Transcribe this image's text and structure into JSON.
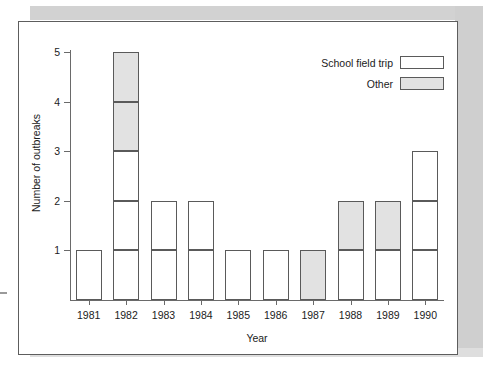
{
  "chart_data": {
    "type": "bar",
    "subtype": "stacked-bar",
    "title": "",
    "xlabel": "Year",
    "ylabel": "Number of outbreaks",
    "categories": [
      "1981",
      "1982",
      "1983",
      "1984",
      "1985",
      "1986",
      "1987",
      "1988",
      "1989",
      "1990"
    ],
    "series": [
      {
        "name": "School field trip",
        "fill": "#ffffff",
        "values": [
          1,
          3,
          2,
          2,
          1,
          1,
          0,
          1,
          1,
          3
        ]
      },
      {
        "name": "Other",
        "fill": "#e2e2e2",
        "values": [
          0,
          2,
          0,
          0,
          0,
          0,
          1,
          1,
          1,
          0
        ]
      }
    ],
    "totals": [
      1,
      5,
      2,
      2,
      1,
      1,
      1,
      2,
      2,
      3
    ],
    "ylim": [
      0,
      5.3
    ],
    "y_ticks": [
      1,
      2,
      3,
      4,
      5
    ],
    "y_tick_labels": [
      "1",
      "2",
      "3",
      "4",
      "5"
    ],
    "grid": false,
    "legend_position": "top-right",
    "unit_separator_lines": true,
    "note": "Each bar is subdivided into unit-high blocks; white blocks are School field trip outbreaks, shaded blocks are Other."
  },
  "axes": {
    "y_title": "Number of outbreaks",
    "x_title": "Year"
  },
  "legend": {
    "entries": [
      {
        "label": "School field trip",
        "swatch": "white-box"
      },
      {
        "label": "Other",
        "swatch": "gray-box"
      }
    ]
  },
  "colors": {
    "frame": "#5d5d5d",
    "axis": "#6a6a6a",
    "bar_outline": "#5a5a5a",
    "school_fill": "#ffffff",
    "other_fill": "#e2e2e2",
    "text": "#1b1b1b",
    "scan_shadow": "#d2d2d2"
  }
}
